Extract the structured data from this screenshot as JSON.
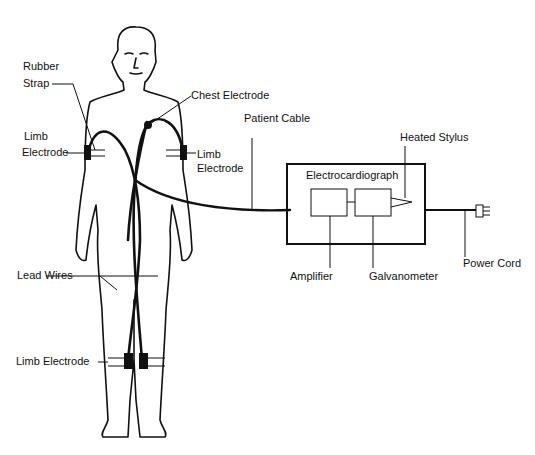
{
  "diagram": {
    "labels": {
      "rubber_strap_1": "Rubber",
      "rubber_strap_2": "Strap",
      "chest_electrode": "Chest Electrode",
      "limb_electrode_left_1": "Limb",
      "limb_electrode_left_2": "Electrode",
      "limb_electrode_right_1": "Limb",
      "limb_electrode_right_2": "Electrode",
      "patient_cable": "Patient Cable",
      "heated_stylus": "Heated Stylus",
      "electrocardiograph": "Electrocardiograph",
      "amplifier": "Amplifier",
      "galvanometer": "Galvanometer",
      "power_cord": "Power Cord",
      "lead_wires": "Lead Wires",
      "limb_electrode_leg": "Limb Electrode"
    }
  }
}
